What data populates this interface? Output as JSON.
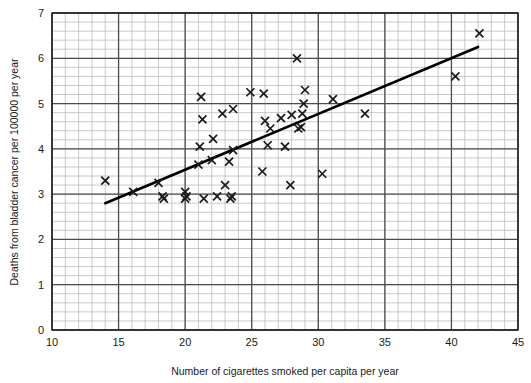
{
  "chart_data": {
    "type": "scatter",
    "title": "",
    "xlabel": "Number of cigarettes smoked per capita per year",
    "ylabel": "Deaths from bladder cancer per 100000 per year",
    "xlim": [
      10,
      45
    ],
    "ylim": [
      0,
      7
    ],
    "x_major_ticks": [
      10,
      15,
      20,
      25,
      30,
      35,
      40,
      45
    ],
    "y_major_ticks": [
      0,
      1,
      2,
      3,
      4,
      5,
      6,
      7
    ],
    "x_minor_step": 1,
    "y_minor_step": 0.2,
    "grid": true,
    "legend": "none",
    "marker": "x",
    "marker_color": "#1a1a1a",
    "points": [
      {
        "x": 14.0,
        "y": 3.3
      },
      {
        "x": 16.1,
        "y": 3.05
      },
      {
        "x": 18.0,
        "y": 3.25
      },
      {
        "x": 18.3,
        "y": 2.95
      },
      {
        "x": 18.4,
        "y": 2.9
      },
      {
        "x": 20.0,
        "y": 3.05
      },
      {
        "x": 20.0,
        "y": 2.9
      },
      {
        "x": 20.1,
        "y": 2.95
      },
      {
        "x": 21.0,
        "y": 3.65
      },
      {
        "x": 21.1,
        "y": 4.05
      },
      {
        "x": 21.2,
        "y": 5.15
      },
      {
        "x": 21.3,
        "y": 4.65
      },
      {
        "x": 21.4,
        "y": 2.9
      },
      {
        "x": 22.0,
        "y": 3.75
      },
      {
        "x": 22.1,
        "y": 4.22
      },
      {
        "x": 22.4,
        "y": 2.95
      },
      {
        "x": 22.8,
        "y": 4.78
      },
      {
        "x": 23.0,
        "y": 3.2
      },
      {
        "x": 23.3,
        "y": 3.72
      },
      {
        "x": 23.4,
        "y": 2.9
      },
      {
        "x": 23.5,
        "y": 2.95
      },
      {
        "x": 23.6,
        "y": 3.97
      },
      {
        "x": 23.6,
        "y": 4.88
      },
      {
        "x": 24.9,
        "y": 5.25
      },
      {
        "x": 25.8,
        "y": 3.5
      },
      {
        "x": 25.9,
        "y": 5.22
      },
      {
        "x": 26.0,
        "y": 4.62
      },
      {
        "x": 26.2,
        "y": 4.08
      },
      {
        "x": 26.4,
        "y": 4.45
      },
      {
        "x": 27.2,
        "y": 4.68
      },
      {
        "x": 27.5,
        "y": 4.05
      },
      {
        "x": 27.9,
        "y": 3.2
      },
      {
        "x": 28.0,
        "y": 4.75
      },
      {
        "x": 28.4,
        "y": 6.0
      },
      {
        "x": 28.5,
        "y": 4.45
      },
      {
        "x": 28.7,
        "y": 4.48
      },
      {
        "x": 28.8,
        "y": 4.78
      },
      {
        "x": 28.9,
        "y": 5.0
      },
      {
        "x": 29.0,
        "y": 5.3
      },
      {
        "x": 30.3,
        "y": 3.45
      },
      {
        "x": 31.1,
        "y": 5.1
      },
      {
        "x": 33.5,
        "y": 4.78
      },
      {
        "x": 40.3,
        "y": 5.6
      },
      {
        "x": 42.1,
        "y": 6.55
      }
    ],
    "trend_line": {
      "x1": 14.0,
      "y1": 2.8,
      "x2": 42.0,
      "y2": 6.25,
      "color": "#000000",
      "width": 2.6
    },
    "axis_colors": {
      "major_grid": "#4d4d4d",
      "minor_grid": "#b3b3b3",
      "frame": "#1a1a1a"
    }
  }
}
